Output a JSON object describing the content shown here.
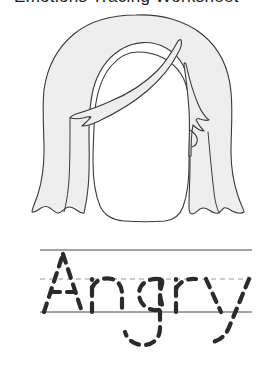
{
  "page": {
    "title": "Angry",
    "background_color": "#ffffff",
    "width": 272,
    "height": 371
  },
  "header": {
    "text": "Emotions Tracing Worksheet",
    "note": "clipped at top edge, only letter descenders visible",
    "color": "#1b1b1b"
  },
  "illustration": {
    "name": "face-with-hair",
    "description": "Outline drawing of a head with long side-parted hair, blank face",
    "hair_fill": "#eeeeee",
    "hair_stroke": "#3a3a3a",
    "face_fill": "#ffffff",
    "face_stroke": "#3a3a3a",
    "stroke_width": 1.1
  },
  "tracing": {
    "word": "Angry",
    "letters": [
      "A",
      "n",
      "g",
      "r",
      "y"
    ],
    "style": "dashed-trace",
    "dash_color": "#2b2b2b",
    "dash_width": 4.2,
    "dash_pattern": "9 7",
    "guides": {
      "top_line": {
        "name": "top-line",
        "y": 18,
        "style": "solid",
        "color": "#4a4a4a",
        "width": 1.2
      },
      "mid_line": {
        "name": "mid-dashed-line",
        "y": 47,
        "style": "dashed",
        "color": "#9a9a9a",
        "width": 1.0,
        "dash": "5 4"
      },
      "base_line": {
        "name": "baseline",
        "y": 80,
        "style": "solid",
        "color": "#4a4a4a",
        "width": 1.2
      },
      "x_start": 40,
      "x_end": 252
    }
  },
  "colors": {
    "ink": "#2b2b2b",
    "guide_solid": "#4a4a4a",
    "guide_dashed": "#9a9a9a",
    "hair": "#eeeeee",
    "outline": "#3a3a3a"
  }
}
